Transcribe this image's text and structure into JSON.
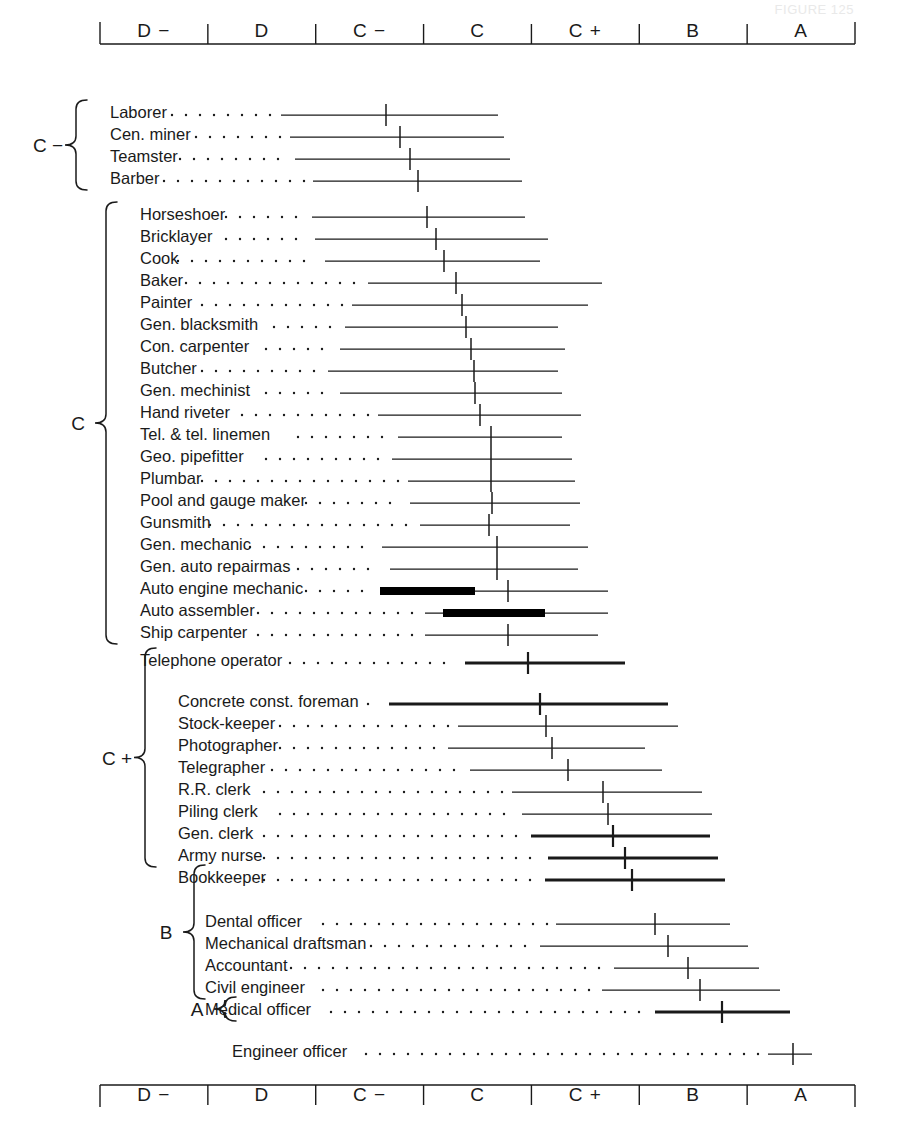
{
  "running_head": "FIGURE 125",
  "axis": {
    "name": "intelligence-rating-scale",
    "categories": [
      "D −",
      "D",
      "C −",
      "C",
      "C +",
      "B",
      "A"
    ],
    "left_px": 100,
    "right_px": 855,
    "top_axis_y": 44,
    "bottom_axis_y": 1085
  },
  "groups": [
    {
      "label": "C −",
      "label_x": 48,
      "rows": [
        0,
        3
      ]
    },
    {
      "label": "C",
      "label_x": 78,
      "rows": [
        4,
        23
      ]
    },
    {
      "label": "C +",
      "label_x": 117,
      "rows": [
        24,
        32
      ]
    },
    {
      "label": "B",
      "label_x": 166,
      "rows": [
        33,
        37
      ]
    },
    {
      "label": "A",
      "label_x": 197,
      "rows": [
        38,
        38
      ]
    }
  ],
  "chart_data": {
    "type": "range-with-median",
    "xlabel": "Army Alpha letter grade",
    "ylabel": "Occupation",
    "x_categories": [
      "D −",
      "D",
      "C −",
      "C",
      "C +",
      "B",
      "A"
    ],
    "grid": false,
    "legend": null,
    "rows": [
      {
        "label": "Laborer",
        "label_x": 110,
        "y": 112,
        "line_start": 281,
        "line_end": 498,
        "median": 386,
        "weight": "thin",
        "block": null
      },
      {
        "label": "Cen. miner",
        "label_x": 110,
        "y": 134,
        "line_start": 290,
        "line_end": 504,
        "median": 400,
        "weight": "thin",
        "block": null
      },
      {
        "label": "Teamster",
        "label_x": 110,
        "y": 156,
        "line_start": 295,
        "line_end": 510,
        "median": 410,
        "weight": "thin",
        "block": null
      },
      {
        "label": "Barber",
        "label_x": 110,
        "y": 178,
        "line_start": 313,
        "line_end": 522,
        "median": 418,
        "weight": "thin",
        "block": null
      },
      {
        "label": "Horseshoer",
        "label_x": 140,
        "y": 214,
        "line_start": 312,
        "line_end": 525,
        "median": 427,
        "weight": "thin",
        "block": null
      },
      {
        "label": "Bricklayer",
        "label_x": 140,
        "y": 236,
        "line_start": 315,
        "line_end": 548,
        "median": 436,
        "weight": "thin",
        "block": null
      },
      {
        "label": "Cook",
        "label_x": 140,
        "y": 258,
        "line_start": 325,
        "line_end": 540,
        "median": 444,
        "weight": "thin",
        "block": null
      },
      {
        "label": "Baker",
        "label_x": 140,
        "y": 280,
        "line_start": 368,
        "line_end": 602,
        "median": 456,
        "weight": "thin",
        "block": null
      },
      {
        "label": "Painter",
        "label_x": 140,
        "y": 302,
        "line_start": 352,
        "line_end": 588,
        "median": 462,
        "weight": "thin",
        "block": null
      },
      {
        "label": "Gen.  blacksmith",
        "label_x": 140,
        "y": 324,
        "line_start": 345,
        "line_end": 558,
        "median": 466,
        "weight": "thin",
        "block": null
      },
      {
        "label": "Con.  carpenter",
        "label_x": 140,
        "y": 346,
        "line_start": 340,
        "line_end": 565,
        "median": 471,
        "weight": "thin",
        "block": null
      },
      {
        "label": "Butcher",
        "label_x": 140,
        "y": 368,
        "line_start": 328,
        "line_end": 558,
        "median": 474,
        "weight": "thin",
        "block": null
      },
      {
        "label": "Gen.  mechinist",
        "label_x": 140,
        "y": 390,
        "line_start": 340,
        "line_end": 562,
        "median": 475,
        "weight": "thin",
        "block": null
      },
      {
        "label": "Hand riveter",
        "label_x": 140,
        "y": 412,
        "line_start": 378,
        "line_end": 581,
        "median": 480,
        "weight": "thin",
        "block": null
      },
      {
        "label": "Tel. & tel. linemen",
        "label_x": 140,
        "y": 434,
        "line_start": 398,
        "line_end": 562,
        "median": 491,
        "weight": "thin",
        "block": null
      },
      {
        "label": "Geo. pipefitter",
        "label_x": 140,
        "y": 456,
        "line_start": 392,
        "line_end": 572,
        "median": 491,
        "weight": "thin",
        "block": null
      },
      {
        "label": "Plumbar",
        "label_x": 140,
        "y": 478,
        "line_start": 408,
        "line_end": 575,
        "median": 491,
        "weight": "thin",
        "block": null
      },
      {
        "label": "Pool and gauge maker",
        "label_x": 140,
        "y": 500,
        "line_start": 410,
        "line_end": 580,
        "median": 492,
        "weight": "thin",
        "block": null
      },
      {
        "label": "Gunsmith",
        "label_x": 140,
        "y": 522,
        "line_start": 420,
        "line_end": 570,
        "median": 489,
        "weight": "thin",
        "block": null
      },
      {
        "label": "Gen. mechanic",
        "label_x": 140,
        "y": 544,
        "line_start": 382,
        "line_end": 588,
        "median": 497,
        "weight": "thin",
        "block": null
      },
      {
        "label": "Gen. auto repairmas",
        "label_x": 140,
        "y": 566,
        "line_start": 390,
        "line_end": 578,
        "median": 497,
        "weight": "thin",
        "block": null
      },
      {
        "label": "Auto engine mechanic",
        "label_x": 140,
        "y": 588,
        "line_start": 380,
        "line_end": 608,
        "median": 508,
        "weight": "thin",
        "block": {
          "start": 380,
          "end": 475
        }
      },
      {
        "label": "Auto assembler",
        "label_x": 140,
        "y": 610,
        "line_start": 425,
        "line_end": 608,
        "median": null,
        "weight": "thin",
        "block": {
          "start": 443,
          "end": 545
        }
      },
      {
        "label": "Ship carpenter",
        "label_x": 140,
        "y": 632,
        "line_start": 425,
        "line_end": 598,
        "median": 508,
        "weight": "thin",
        "block": null
      },
      {
        "label": "Telephone operator",
        "label_x": 140,
        "y": 660,
        "line_start": 465,
        "line_end": 625,
        "median": 528,
        "weight": "heavy",
        "block": null
      },
      {
        "label": "Concrete const. foreman",
        "label_x": 178,
        "y": 701,
        "line_start": 389,
        "line_end": 668,
        "median": 540,
        "weight": "heavy",
        "block": null
      },
      {
        "label": "Stock-keeper",
        "label_x": 178,
        "y": 723,
        "line_start": 458,
        "line_end": 678,
        "median": 546,
        "weight": "thin",
        "block": null
      },
      {
        "label": "Photographer",
        "label_x": 178,
        "y": 745,
        "line_start": 448,
        "line_end": 645,
        "median": 552,
        "weight": "thin",
        "block": null
      },
      {
        "label": "Telegrapher",
        "label_x": 178,
        "y": 767,
        "line_start": 470,
        "line_end": 662,
        "median": 568,
        "weight": "thin",
        "block": null
      },
      {
        "label": "R.R. clerk",
        "label_x": 178,
        "y": 789,
        "line_start": 512,
        "line_end": 702,
        "median": 603,
        "weight": "thin",
        "block": null
      },
      {
        "label": "Piling clerk",
        "label_x": 178,
        "y": 811,
        "line_start": 522,
        "line_end": 712,
        "median": 608,
        "weight": "thin",
        "block": null
      },
      {
        "label": "Gen. clerk",
        "label_x": 178,
        "y": 833,
        "line_start": 531,
        "line_end": 710,
        "median": 613,
        "weight": "heavy",
        "block": null
      },
      {
        "label": "Army nurse",
        "label_x": 178,
        "y": 855,
        "line_start": 548,
        "line_end": 718,
        "median": 625,
        "weight": "heavy",
        "block": null
      },
      {
        "label": "Bookkeeper",
        "label_x": 178,
        "y": 877,
        "line_start": 545,
        "line_end": 725,
        "median": 632,
        "weight": "heavy",
        "block": null
      },
      {
        "label": "Dental officer",
        "label_x": 205,
        "y": 921,
        "line_start": 556,
        "line_end": 730,
        "median": 655,
        "weight": "thin",
        "block": null
      },
      {
        "label": "Mechanical draftsman",
        "label_x": 205,
        "y": 943,
        "line_start": 540,
        "line_end": 748,
        "median": 668,
        "weight": "thin",
        "block": null
      },
      {
        "label": "Accountant",
        "label_x": 205,
        "y": 965,
        "line_start": 614,
        "line_end": 759,
        "median": 688,
        "weight": "thin",
        "block": null
      },
      {
        "label": "Civil engineer",
        "label_x": 205,
        "y": 987,
        "line_start": 602,
        "line_end": 780,
        "median": 700,
        "weight": "thin",
        "block": null
      },
      {
        "label": "Medical officer",
        "label_x": 205,
        "y": 1009,
        "line_start": 655,
        "line_end": 790,
        "median": 722,
        "weight": "heavy",
        "block": null
      },
      {
        "label": "Engineer officer",
        "label_x": 232,
        "y": 1051,
        "line_start": 768,
        "line_end": 812,
        "median": 793,
        "weight": "thin",
        "block": null
      }
    ]
  }
}
